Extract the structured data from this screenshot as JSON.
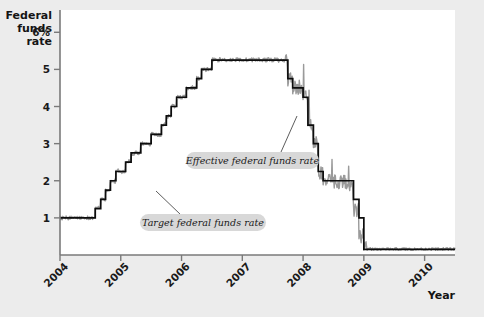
{
  "chart_data": {
    "type": "line",
    "title": "",
    "ylabel": "Federal funds rate",
    "xlabel": "Year",
    "ylim": [
      0,
      6.6
    ],
    "xlim": [
      2004.0,
      2010.5
    ],
    "grid": false,
    "legend_position": "inline-annotations",
    "y_ticks": [
      1,
      2,
      3,
      4,
      5,
      6
    ],
    "y_tick_labels": [
      "1",
      "2",
      "3",
      "4",
      "5",
      "6%"
    ],
    "x_ticks": [
      2004,
      2005,
      2006,
      2007,
      2008,
      2009,
      2010
    ],
    "x_tick_labels": [
      "2004",
      "2005",
      "2006",
      "2007",
      "2008",
      "2009",
      "2010"
    ],
    "annotations": [
      {
        "name": "effective-rate-callout",
        "text": "Effective federal funds rate"
      },
      {
        "name": "target-rate-callout",
        "text": "Target federal funds rate"
      }
    ],
    "series": [
      {
        "name": "Target federal funds rate",
        "color": "#0d0d0d",
        "style": "step",
        "x": [
          2004.0,
          2004.5,
          2004.58,
          2004.67,
          2004.75,
          2004.83,
          2004.92,
          2005.0,
          2005.08,
          2005.17,
          2005.25,
          2005.33,
          2005.42,
          2005.5,
          2005.58,
          2005.67,
          2005.75,
          2005.83,
          2005.92,
          2006.0,
          2006.08,
          2006.17,
          2006.25,
          2006.33,
          2006.42,
          2006.5,
          2007.58,
          2007.75,
          2007.83,
          2008.0,
          2008.08,
          2008.17,
          2008.25,
          2008.33,
          2008.75,
          2008.83,
          2008.92,
          2009.0,
          2010.5
        ],
        "values": [
          1.0,
          1.0,
          1.25,
          1.5,
          1.75,
          2.0,
          2.25,
          2.25,
          2.5,
          2.75,
          2.75,
          3.0,
          3.0,
          3.25,
          3.25,
          3.5,
          3.75,
          4.0,
          4.25,
          4.25,
          4.5,
          4.5,
          4.75,
          5.0,
          5.0,
          5.25,
          5.25,
          4.75,
          4.5,
          4.25,
          3.5,
          3.0,
          2.25,
          2.0,
          2.0,
          1.5,
          1.0,
          0.15,
          0.15
        ]
      },
      {
        "name": "Effective federal funds rate",
        "color": "#9a9a9a",
        "style": "noisy-step",
        "x": [
          2004.0,
          2004.5,
          2004.58,
          2004.67,
          2004.75,
          2004.83,
          2004.92,
          2005.0,
          2005.08,
          2005.17,
          2005.25,
          2005.33,
          2005.42,
          2005.5,
          2005.58,
          2005.67,
          2005.75,
          2005.83,
          2005.92,
          2006.0,
          2006.08,
          2006.17,
          2006.25,
          2006.33,
          2006.42,
          2006.5,
          2007.58,
          2007.75,
          2007.83,
          2008.0,
          2008.08,
          2008.17,
          2008.25,
          2008.33,
          2008.75,
          2008.83,
          2008.92,
          2009.0,
          2010.5
        ],
        "values": [
          1.0,
          1.01,
          1.26,
          1.49,
          1.76,
          1.99,
          2.27,
          2.24,
          2.52,
          2.74,
          2.76,
          3.01,
          2.99,
          3.26,
          3.24,
          3.51,
          3.74,
          4.01,
          4.24,
          4.26,
          4.49,
          4.51,
          4.76,
          4.99,
          5.01,
          5.26,
          5.24,
          4.74,
          4.51,
          4.24,
          3.49,
          2.99,
          2.24,
          1.98,
          1.81,
          1.2,
          0.5,
          0.16,
          0.18
        ]
      }
    ]
  },
  "axes": {
    "y_title_lines": [
      "Federal",
      "funds",
      "rate"
    ],
    "x_title": "Year"
  }
}
